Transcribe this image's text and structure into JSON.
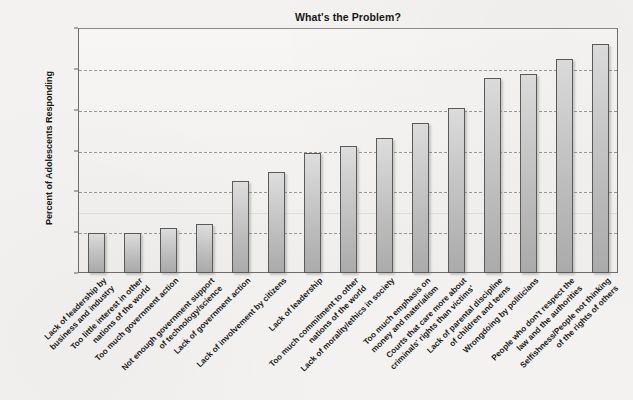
{
  "chart_data": {
    "type": "bar",
    "title": "What's the Problem?",
    "xlabel": "",
    "ylabel": "Percent of Adolescents Responding",
    "ylim": [
      0,
      60
    ],
    "yticks": [
      0,
      10,
      20,
      30,
      40,
      50,
      60
    ],
    "grid": true,
    "legend": "none",
    "orientation": "vertical",
    "bar_color": "#cfcfcf",
    "bar_border_color": "#5a5a5a",
    "categories": [
      "Lack of leadership by business and industry",
      "Too little interest in other nations of the world",
      "Too much government action",
      "Not enough government support of technology/science",
      "Lack of government action",
      "Lack of involvement by citizens",
      "Lack of leadership",
      "Too much commitment to other nations of the world",
      "Lack of morality/ethics in society",
      "Too much emphasis on money and materialism",
      "Courts that care more about criminals' rights than victims'",
      "Lack of parental discipline of children and teens",
      "Wrongdoing by politicians",
      "People who don't respect the law and the authorities",
      "Selfishness/People not thinking of the rights of others"
    ],
    "category_lines": [
      [
        "Lack of leadership by",
        "business and industry"
      ],
      [
        "Too little interest in other",
        "nations of the world"
      ],
      [
        "Too much government action"
      ],
      [
        "Not enough government support",
        "of technology/science"
      ],
      [
        "Lack of government action"
      ],
      [
        "Lack of involvement by citizens"
      ],
      [
        "Lack of leadership"
      ],
      [
        "Too much commitment to other",
        "nations of the world"
      ],
      [
        "Lack of morality/ethics in society"
      ],
      [
        "Too much emphasis on",
        "money and materialism"
      ],
      [
        "Courts that care more about",
        "criminals' rights than victims'"
      ],
      [
        "Lack of parental discipline",
        "of children and teens"
      ],
      [
        "Wrongdoing by politicians"
      ],
      [
        "People who don't respect the",
        "law and the authorities"
      ],
      [
        "Selfishness/People not thinking",
        "of the rights of others"
      ]
    ],
    "values": [
      9.8,
      9.7,
      11.0,
      12.0,
      22.5,
      24.7,
      29.5,
      31.0,
      33.0,
      36.8,
      40.5,
      47.7,
      48.8,
      52.5,
      56.0
    ]
  }
}
